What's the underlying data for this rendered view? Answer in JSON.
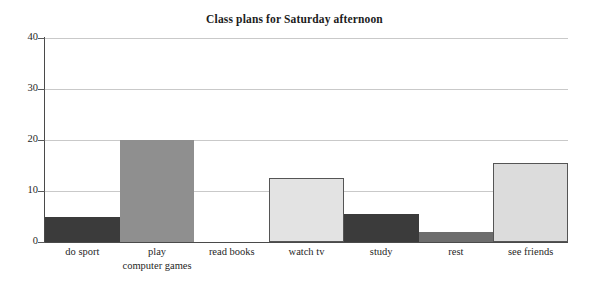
{
  "chart_data": {
    "type": "bar",
    "title": "Class plans for Saturday afternoon",
    "xlabel": "",
    "ylabel": "",
    "categories": [
      "do sport",
      "play computer games",
      "read books",
      "watch tv",
      "study",
      "rest",
      "see friends"
    ],
    "category_lines": [
      [
        "do sport"
      ],
      [
        "play",
        "computer games"
      ],
      [
        "read books"
      ],
      [
        "watch tv"
      ],
      [
        "study"
      ],
      [
        "rest"
      ],
      [
        "see friends"
      ]
    ],
    "values": [
      5,
      20,
      0,
      12.5,
      5.5,
      2,
      15.5
    ],
    "bar_colors": [
      "#3b3b3b",
      "#8f8f8f",
      "#ffffff",
      "#e3e3e3",
      "#3b3b3b",
      "#6d6d6d",
      "#dcdcdc"
    ],
    "bar_has_edge": [
      false,
      false,
      false,
      true,
      false,
      false,
      true
    ],
    "ylim": [
      0,
      40
    ],
    "ytick_labels": [
      "0",
      "10",
      "20",
      "30",
      "40"
    ],
    "ytick_values": [
      0,
      10,
      20,
      30,
      40
    ],
    "grid": true,
    "legend": "none",
    "axis_color": "#4a4a4a",
    "grid_color": "#c9c9c9",
    "background": "#ffffff"
  }
}
